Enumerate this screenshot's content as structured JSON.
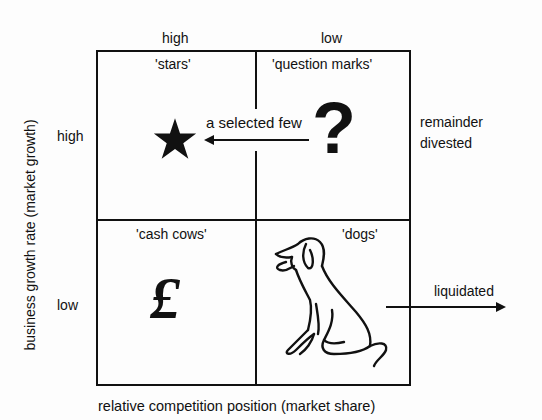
{
  "columns": {
    "high": "high",
    "low": "low"
  },
  "rows": {
    "high": "high",
    "low": "low"
  },
  "axes": {
    "x_label": "relative competition position (market share)",
    "y_label": "business growth rate (market growth)"
  },
  "quadrants": {
    "stars": {
      "label": "'stars'",
      "icon": "star-icon"
    },
    "question_marks": {
      "label": "'question marks'",
      "icon": "question-mark-icon",
      "glyph": "?"
    },
    "cash_cows": {
      "label": "'cash cows'",
      "icon": "pound-sign-icon",
      "glyph": "£"
    },
    "dogs": {
      "label": "'dogs'",
      "icon": "dog-icon"
    }
  },
  "annotations": {
    "selected_few": "a selected few",
    "remainder_line1": "remainder",
    "remainder_line2": "divested",
    "liquidated": "liquidated"
  }
}
